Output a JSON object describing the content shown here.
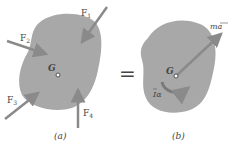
{
  "diagram": {
    "panel_a": {
      "caption": "(a)",
      "center_label": "G",
      "forces": [
        {
          "label": "F",
          "subscript": "1"
        },
        {
          "label": "F",
          "subscript": "2"
        },
        {
          "label": "F",
          "subscript": "3"
        },
        {
          "label": "F",
          "subscript": "4"
        }
      ]
    },
    "equals": "=",
    "panel_b": {
      "caption": "(b)",
      "center_label": "G",
      "linear_label": "ma",
      "angular_label": "Iα"
    },
    "colors": {
      "body_fill": "#a8a8a8",
      "arrow": "#8a8a8a",
      "text": "#444444"
    }
  }
}
